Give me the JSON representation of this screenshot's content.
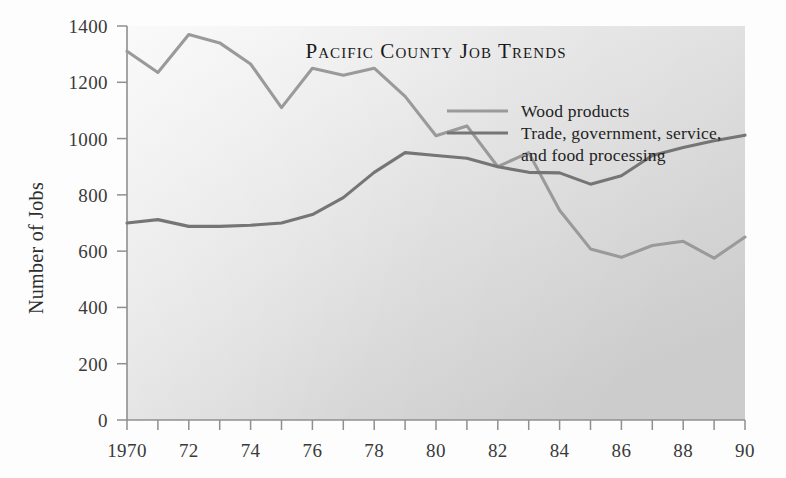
{
  "chart_data": {
    "type": "line",
    "title": "Pacific County Job Trends",
    "xlabel": "",
    "ylabel": "Number of Jobs",
    "xlim": [
      1970,
      1990
    ],
    "ylim": [
      0,
      1400
    ],
    "y_ticks": [
      0,
      200,
      400,
      600,
      800,
      1000,
      1200,
      1400
    ],
    "y_tick_labels": [
      "0",
      "200",
      "400",
      "600",
      "800",
      "1000",
      "1200",
      "1400"
    ],
    "x_ticks": [
      1970,
      1971,
      1972,
      1973,
      1974,
      1975,
      1976,
      1977,
      1978,
      1979,
      1980,
      1981,
      1982,
      1983,
      1984,
      1985,
      1986,
      1987,
      1988,
      1989,
      1990
    ],
    "x_tick_labels": [
      "1970",
      "",
      "72",
      "",
      "74",
      "",
      "76",
      "",
      "78",
      "",
      "80",
      "",
      "82",
      "",
      "84",
      "",
      "86",
      "",
      "88",
      "",
      "90"
    ],
    "grid": false,
    "legend_position": "upper-right-inside",
    "x": [
      1970,
      1971,
      1972,
      1973,
      1974,
      1975,
      1976,
      1977,
      1978,
      1979,
      1980,
      1981,
      1982,
      1983,
      1984,
      1985,
      1986,
      1987,
      1988,
      1989,
      1990
    ],
    "series": [
      {
        "name": "Wood products",
        "color": "#9a9a9a",
        "values": [
          1310,
          1235,
          1370,
          1340,
          1265,
          1110,
          1250,
          1225,
          1250,
          1150,
          1010,
          1045,
          900,
          950,
          745,
          608,
          578,
          620,
          635,
          575,
          650
        ]
      },
      {
        "name": "Trade, government, service, and food processing",
        "color": "#757575",
        "values": [
          700,
          712,
          688,
          688,
          692,
          700,
          730,
          790,
          880,
          950,
          940,
          930,
          900,
          880,
          878,
          838,
          868,
          940,
          968,
          992,
          1012
        ]
      }
    ],
    "legend_entries": [
      {
        "label": "Wood products",
        "color": "#9a9a9a"
      },
      {
        "label": "Trade, government, service,",
        "label2": "and food processing",
        "color": "#757575"
      }
    ]
  }
}
